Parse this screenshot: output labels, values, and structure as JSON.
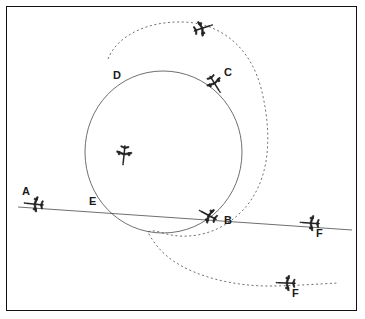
{
  "figure": {
    "frame": true,
    "background_color": "#ffffff",
    "line_color": "#4a4a4a",
    "label_color": "#1b1b1b"
  },
  "labels": [
    {
      "id": "A",
      "text": "A",
      "x": 22,
      "y": 186
    },
    {
      "id": "B",
      "text": "B",
      "x": 224,
      "y": 215
    },
    {
      "id": "C",
      "text": "C",
      "x": 224,
      "y": 67
    },
    {
      "id": "D",
      "text": "D",
      "x": 113,
      "y": 70
    },
    {
      "id": "E",
      "text": "E",
      "x": 89,
      "y": 196
    },
    {
      "id": "F1",
      "text": "F",
      "x": 316,
      "y": 228
    },
    {
      "id": "F2",
      "text": "F",
      "x": 292,
      "y": 288
    }
  ],
  "aircraft": [
    {
      "id": "plane-top",
      "label": "",
      "x": 203,
      "y": 28,
      "rotation": -18,
      "on_path": "dashed-loop"
    },
    {
      "id": "plane-c",
      "label": "C",
      "x": 215,
      "y": 84,
      "rotation": 58,
      "on_path": "solid-circle"
    },
    {
      "id": "plane-inner",
      "label": "",
      "x": 124,
      "y": 155,
      "rotation": 96,
      "on_path": "dashed-loop"
    },
    {
      "id": "plane-b",
      "label": "B",
      "x": 208,
      "y": 215,
      "rotation": 208,
      "on_path": "solid-circle"
    },
    {
      "id": "plane-a",
      "label": "A",
      "x": 34,
      "y": 204,
      "rotation": 186,
      "on_path": "straight-line"
    },
    {
      "id": "plane-f-line",
      "label": "F",
      "x": 310,
      "y": 223,
      "rotation": 184,
      "on_path": "straight-line"
    },
    {
      "id": "plane-f-dash",
      "label": "F",
      "x": 286,
      "y": 283,
      "rotation": 182,
      "on_path": "dashed-loop"
    }
  ],
  "paths": [
    {
      "id": "solid-circle",
      "style": "solid",
      "description": "circular flight path",
      "d": "M 163 71 C 207 71 242 107 242 152 C 242 197 207 233 163 233 C 119 233 85 197 85 152 C 85 107 119 71 163 71 Z"
    },
    {
      "id": "dashed-loop",
      "style": "dashed",
      "description": "dashed looping flight path crossing the circle at D and B",
      "d": "M 108 59 C 118 34 150 21 183 22 C 221 23 252 48 262 92 C 274 143 268 188 238 215 C 215 236 185 240 163 233 C 152 229 148 232 148 232 C 148 232 155 248 172 260 C 196 277 234 286 268 286 C 292 286 318 284 338 283"
    },
    {
      "id": "straight-line",
      "style": "solid",
      "description": "straight flight path from A through B to F",
      "d": "M 18 207 L 352 230"
    }
  ]
}
